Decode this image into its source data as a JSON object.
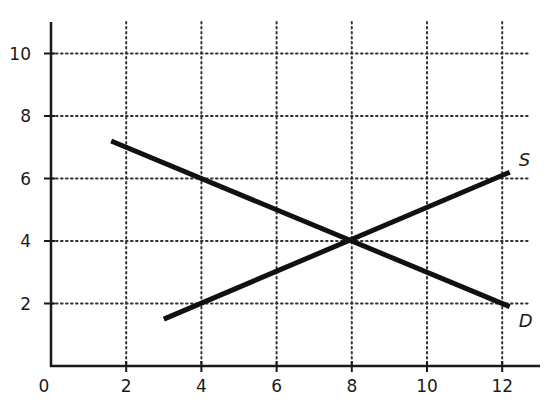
{
  "chart_data": {
    "type": "line",
    "title": "",
    "xlabel": "",
    "ylabel": "",
    "xlim": [
      0,
      13
    ],
    "ylim": [
      0,
      11
    ],
    "grid": true,
    "grid_style": "dotted",
    "x_ticks": [
      0,
      2,
      4,
      6,
      8,
      10,
      12
    ],
    "y_ticks": [
      2,
      4,
      6,
      8,
      10
    ],
    "x_tick_labels": [
      "0",
      "2",
      "4",
      "6",
      "8",
      "10",
      "12"
    ],
    "y_tick_labels": [
      "2",
      "4",
      "6",
      "8",
      "10"
    ],
    "series": [
      {
        "name": "D",
        "label": "D",
        "points": [
          [
            1.6,
            7.2
          ],
          [
            12.2,
            1.9
          ]
        ]
      },
      {
        "name": "S",
        "label": "S",
        "points": [
          [
            3.0,
            1.5
          ],
          [
            12.2,
            6.2
          ]
        ]
      }
    ],
    "equilibrium": {
      "x": 8,
      "y": 4
    },
    "legend": "none (curve labels at line ends)",
    "colors": {
      "line": "#111111",
      "grid": "#333333",
      "axis": "#1a1a1a"
    }
  }
}
